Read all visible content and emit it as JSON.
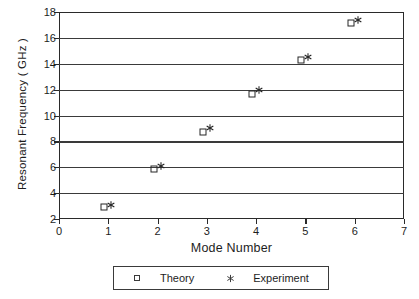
{
  "chart_data": {
    "type": "scatter",
    "title": "",
    "xlabel": "Mode Number",
    "ylabel": "Resonant Frequency ( GHz )",
    "xlim": [
      0,
      7
    ],
    "ylim": [
      2,
      18
    ],
    "xticks": [
      0,
      1,
      2,
      3,
      4,
      5,
      6,
      7
    ],
    "yticks": [
      2,
      4,
      6,
      8,
      10,
      12,
      14,
      16,
      18
    ],
    "grid": "horizontal",
    "legend_position": "below-axes",
    "x": [
      1,
      2,
      3,
      4,
      5,
      6
    ],
    "series": [
      {
        "name": "Theory",
        "marker": "open-square",
        "x_offset": -0.08,
        "values": [
          2.9,
          5.85,
          8.7,
          11.7,
          14.3,
          17.15
        ]
      },
      {
        "name": "Experiment",
        "marker": "asterisk",
        "x_offset": 0.06,
        "values": [
          3.1,
          6.1,
          9.0,
          11.95,
          14.5,
          17.35
        ]
      }
    ]
  },
  "axes": {
    "x_title": "Mode Number",
    "y_title": "Resonant Frequency ( GHz )",
    "x_tick_labels": [
      "0",
      "1",
      "2",
      "3",
      "4",
      "5",
      "6",
      "7"
    ],
    "y_tick_labels": [
      "2",
      "4",
      "6",
      "8",
      "10",
      "12",
      "14",
      "16",
      "18"
    ]
  },
  "legend": {
    "entries": [
      {
        "label": "Theory",
        "marker": "open-square"
      },
      {
        "label": "Experiment",
        "marker": "asterisk"
      }
    ]
  },
  "colors": {
    "axis": "#2a2a2a",
    "grid": "#3a3a3a",
    "marker": "#262626",
    "background": "#ffffff"
  }
}
